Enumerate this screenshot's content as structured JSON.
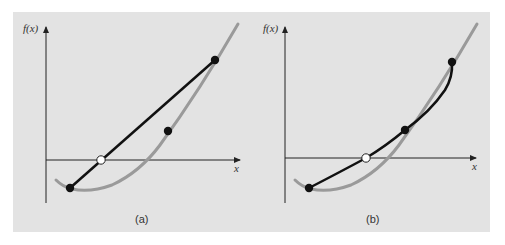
{
  "figure": {
    "background_color": "#e3e3e3",
    "curve_color": "#9a9a9a",
    "approx_color": "#111111",
    "panels": [
      {
        "id": "a",
        "label": "(a)",
        "y_axis_label": "f(x)",
        "x_axis_label": "x",
        "description": "Linear extrapolation: straight line through two points; white point marks where the line crosses the x-axis",
        "points": {
          "lower": {
            "fill": "black"
          },
          "middle": {
            "fill": "black"
          },
          "upper": {
            "fill": "black"
          },
          "root_estimate": {
            "fill": "white"
          }
        }
      },
      {
        "id": "b",
        "label": "(b)",
        "y_axis_label": "f(x)",
        "x_axis_label": "x",
        "description": "Quadratic interpolation: parabola through three points; white point marks where the parabola crosses the x-axis",
        "points": {
          "lower": {
            "fill": "black"
          },
          "middle": {
            "fill": "black"
          },
          "upper": {
            "fill": "black"
          },
          "root_estimate": {
            "fill": "white"
          }
        }
      }
    ]
  }
}
